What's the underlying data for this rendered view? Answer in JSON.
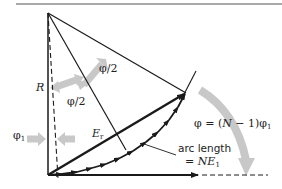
{
  "diagram": {
    "labels": {
      "radius": "R",
      "half_angle_upper": "φ/2",
      "half_angle_lower": "φ/2",
      "phase_step": "φ",
      "phase_step_sub": "1",
      "resultant": "E",
      "resultant_sub": "r",
      "total_phase_prefix": "φ = (",
      "total_phase_N": "N",
      "total_phase_suffix": " − 1)φ",
      "total_phase_sub": "1",
      "arc_length_line1": "arc length",
      "arc_length_line2_prefix": "= ",
      "arc_length_line2_N": "NE",
      "arc_length_line2_sub": "1"
    },
    "colors": {
      "line": "#1a1a1a",
      "angle_arrow": "#c8c8c8",
      "background": "#ffffff"
    },
    "phasor_count_drawn": 10
  }
}
